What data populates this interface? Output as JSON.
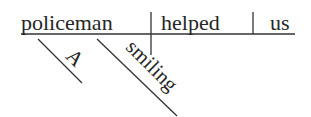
{
  "diagram": {
    "type": "Reed-Kellogg sentence diagram",
    "sentence": "A smiling policeman helped us",
    "line_color": "#333333",
    "text_color": "#262626",
    "baseline": {
      "subject": "policeman",
      "verb": "helped",
      "direct_object": "us"
    },
    "modifiers": [
      {
        "word": "A",
        "modifies": "policeman",
        "role": "article"
      },
      {
        "word": "smiling",
        "modifies": "policeman",
        "role": "adjective"
      }
    ]
  }
}
